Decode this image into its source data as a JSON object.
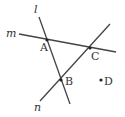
{
  "diagram": {
    "lines": [
      {
        "name": "l",
        "x1": 39,
        "y1": 17,
        "x2": 70,
        "y2": 104,
        "label_x": 34,
        "label_y": 13
      },
      {
        "name": "m",
        "x1": 19,
        "y1": 34,
        "x2": 116,
        "y2": 52,
        "label_x": 6,
        "label_y": 37
      },
      {
        "name": "n",
        "x1": 40,
        "y1": 101,
        "x2": 110,
        "y2": 24,
        "label_x": 34,
        "label_y": 111
      }
    ],
    "points": [
      {
        "name": "A",
        "x": 47,
        "y": 40,
        "label_x": 40,
        "label_y": 51
      },
      {
        "name": "C",
        "x": 90,
        "y": 48,
        "label_x": 91,
        "label_y": 60
      },
      {
        "name": "B",
        "x": 61,
        "y": 80,
        "label_x": 65,
        "label_y": 85
      },
      {
        "name": "D",
        "x": 101,
        "y": 80,
        "label_x": 104,
        "label_y": 85
      }
    ],
    "colors": {
      "stroke": "#444444",
      "text": "#333333",
      "background": "#ffffff"
    }
  }
}
